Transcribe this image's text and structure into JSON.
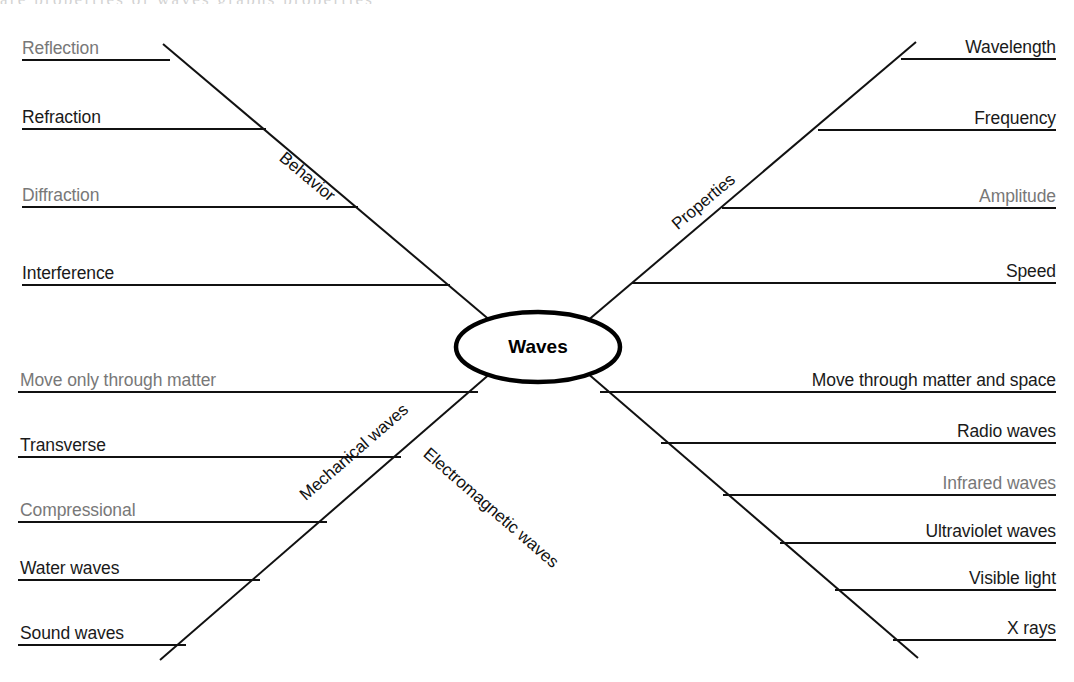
{
  "diagram": {
    "type": "concept-map",
    "title": "Waves",
    "center": {
      "label": "Waves"
    },
    "page_bleed_text": "are properties of waves graphs properties",
    "colors": {
      "line": "#111111",
      "text": "#1a1a1a",
      "text_dim": "#787878",
      "center_stroke": "#000000",
      "background": "#ffffff"
    },
    "branches": [
      {
        "id": "behavior",
        "label": "Behavior",
        "quadrant": "top-left",
        "items": [
          {
            "label": "Reflection",
            "dim": true
          },
          {
            "label": "Refraction",
            "dim": false
          },
          {
            "label": "Diffraction",
            "dim": true
          },
          {
            "label": "Interference",
            "dim": false
          }
        ]
      },
      {
        "id": "properties",
        "label": "Properties",
        "quadrant": "top-right",
        "items": [
          {
            "label": "Wavelength",
            "dim": false
          },
          {
            "label": "Frequency",
            "dim": false
          },
          {
            "label": "Amplitude",
            "dim": true
          },
          {
            "label": "Speed",
            "dim": false
          }
        ]
      },
      {
        "id": "mechanical-waves",
        "label": "Mechanical waves",
        "quadrant": "bottom-left",
        "items": [
          {
            "label": "Move only through matter",
            "dim": true
          },
          {
            "label": "Transverse",
            "dim": false
          },
          {
            "label": "Compressional",
            "dim": true
          },
          {
            "label": "Water waves",
            "dim": false
          },
          {
            "label": "Sound waves",
            "dim": false
          }
        ]
      },
      {
        "id": "electromagnetic-waves",
        "label": "Electromagnetic waves",
        "quadrant": "bottom-right",
        "items": [
          {
            "label": "Move through matter and space",
            "dim": false
          },
          {
            "label": "Radio waves",
            "dim": false
          },
          {
            "label": "Infrared waves",
            "dim": true
          },
          {
            "label": "Ultraviolet waves",
            "dim": false
          },
          {
            "label": "Visible light",
            "dim": false
          },
          {
            "label": "X rays",
            "dim": false
          }
        ]
      }
    ]
  }
}
